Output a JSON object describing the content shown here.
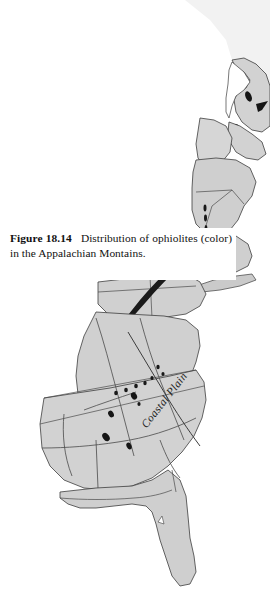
{
  "figure": {
    "label": "Figure 18.14",
    "caption_text": "Distribution of ophiolites (color) in the Appalachian Montains."
  },
  "map": {
    "labels": {
      "coastal_plain": "Coastal Plain"
    },
    "colors": {
      "land_fill": "#d0d0d0",
      "land_fill_light": "#dcdcdc",
      "water_fill": "#ffffff",
      "page_background": "#ffffff",
      "coastline_stroke": "#3a3a3a",
      "internal_boundary_stroke": "#4a4a4a",
      "ophiolite_fill": "#151515",
      "caption_text": "#111111"
    },
    "regions": [
      {
        "name": "newfoundland",
        "label": ""
      },
      {
        "name": "gulf-of-st-lawrence-quebec",
        "label": ""
      },
      {
        "name": "maine-new-brunswick",
        "label": ""
      },
      {
        "name": "new-england",
        "label": ""
      },
      {
        "name": "appalachian-piedmont",
        "label": ""
      },
      {
        "name": "coastal-plain",
        "label": "Coastal Plain"
      },
      {
        "name": "florida-peninsula",
        "label": ""
      }
    ],
    "ophiolite_bodies_count": 19
  }
}
